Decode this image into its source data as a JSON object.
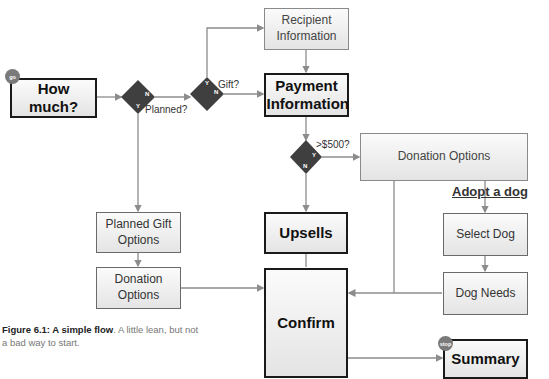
{
  "figure": {
    "caption_bold": "Figure 6.1: A simple flow",
    "caption_rest": ". A little lean, but not a bad way to start."
  },
  "badges": {
    "start": "go",
    "end": "stop"
  },
  "nodes": {
    "how_much": "How much?",
    "recipient_info": "Recipient Information",
    "payment_info": "Payment Information",
    "donation_options_right": "Donation Options",
    "adopt_a_dog": "Adopt a dog",
    "select_dog": "Select Dog",
    "dog_needs": "Dog Needs",
    "upsells": "Upsells",
    "confirm": "Confirm",
    "summary": "Summary",
    "planned_gift_options": "Planned Gift Options",
    "donation_options_left": "Donation Options"
  },
  "decisions": [
    {
      "id": "planned",
      "question": "Planned?",
      "yes": "Y",
      "no": "N"
    },
    {
      "id": "gift",
      "question": "Gift?",
      "yes": "Y",
      "no": "N"
    },
    {
      "id": "over500",
      "question": ">$500?",
      "yes": "Y",
      "no": "N"
    }
  ],
  "colors": {
    "diamond": "#3f3f3f",
    "connector": "#8c8c8c",
    "thick_border": "#1a1a1a",
    "badge": "#7a7a7a"
  }
}
